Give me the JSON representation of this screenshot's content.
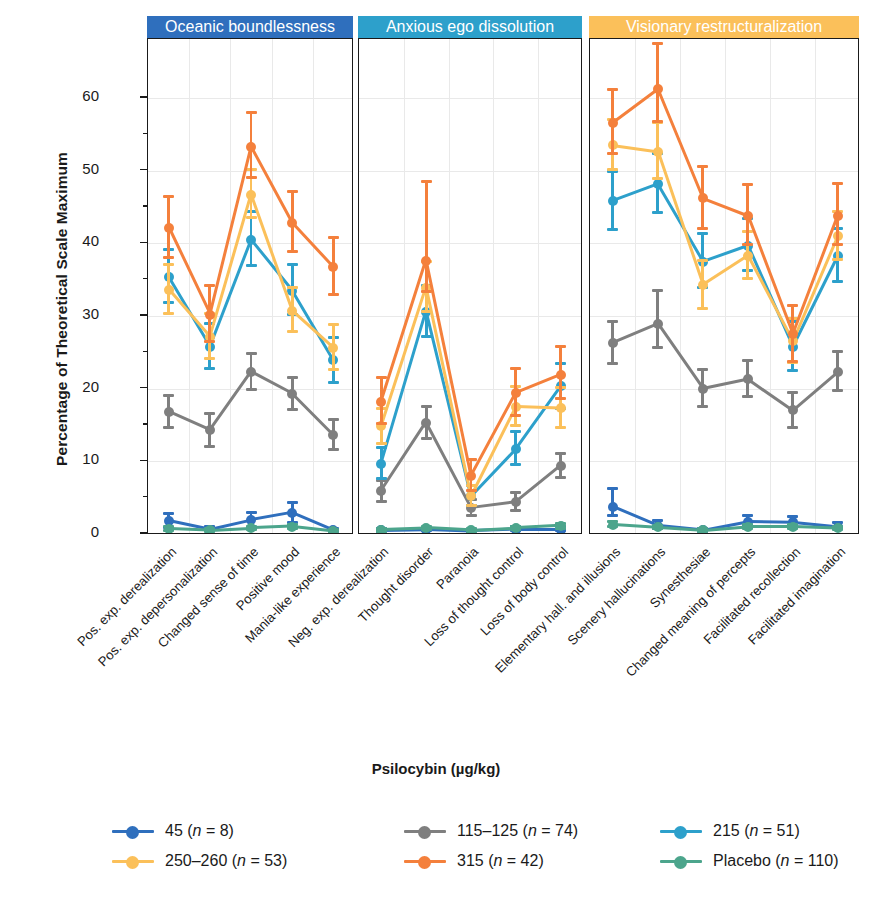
{
  "chart_data": {
    "type": "line",
    "title": "",
    "xlabel": "Psilocybin (µg/kg)",
    "ylabel": "Percentage of Theoretical Scale Maximum",
    "ylim": [
      0,
      68
    ],
    "yticks": [
      0,
      10,
      20,
      30,
      40,
      50,
      60
    ],
    "grid": true,
    "legend_position": "bottom",
    "panels": [
      {
        "label": "Oceanic boundlessness",
        "color": "#2f6fbd",
        "categories": [
          "Pos. exp. derealization",
          "Pos. exp. depersonalization",
          "Changed sense of time",
          "Positive mood",
          "Mania-like experience"
        ]
      },
      {
        "label": "Anxious ego dissolution",
        "color": "#2da0cb",
        "categories": [
          "Neg. exp. derealization",
          "Thought disorder",
          "Paranoia",
          "Loss of thought control",
          "Loss of body control"
        ]
      },
      {
        "label": "Visionary restructuralization",
        "color": "#fbc05a",
        "categories": [
          "Elementary hall. and illusions",
          "Scenery hallucinations",
          "Synesthesiae",
          "Changed meaning of percepts",
          "Facilitated recollection",
          "Facilitated imagination"
        ]
      }
    ],
    "series": [
      {
        "name": "45 (n = 8)",
        "dose": "45",
        "n": 8,
        "color": "#2f6fbd",
        "values": [
          [
            1.8,
            0.6,
            1.9,
            2.9,
            0.5
          ],
          [
            0.5,
            0.6,
            0.4,
            0.6,
            0.6
          ],
          [
            3.7,
            1.1,
            0.5,
            1.7,
            1.6,
            1.0
          ]
        ],
        "err_low": [
          [
            0.9,
            0.1,
            1.0,
            1.3,
            0.1
          ],
          [
            0.1,
            0.1,
            0.1,
            0.1,
            0.1
          ],
          [
            1.2,
            0.3,
            0.1,
            0.5,
            0.5,
            0.3
          ]
        ],
        "err_high": [
          [
            1.0,
            0.4,
            1.1,
            1.5,
            0.3
          ],
          [
            0.3,
            0.3,
            0.2,
            0.4,
            0.4
          ],
          [
            2.6,
            0.8,
            0.3,
            0.9,
            0.8,
            0.6
          ]
        ]
      },
      {
        "name": "115–125 (n = 74)",
        "dose": "115–125",
        "n": 74,
        "color": "#7f7f7f",
        "values": [
          [
            16.8,
            14.3,
            22.3,
            19.3,
            13.6
          ],
          [
            5.9,
            15.3,
            3.6,
            4.4,
            9.4
          ],
          [
            26.3,
            28.9,
            20.0,
            21.3,
            17.0,
            22.3
          ]
        ],
        "err_low": [
          [
            2.2,
            2.2,
            2.4,
            2.2,
            2.0
          ],
          [
            1.4,
            2.1,
            1.1,
            1.1,
            1.6
          ],
          [
            2.8,
            3.2,
            2.4,
            2.4,
            2.4,
            2.5
          ]
        ],
        "err_high": [
          [
            2.2,
            2.3,
            2.5,
            2.3,
            2.1
          ],
          [
            1.5,
            2.2,
            1.2,
            1.3,
            1.7
          ],
          [
            3.0,
            4.6,
            2.6,
            2.6,
            2.5,
            2.8
          ]
        ]
      },
      {
        "name": "215 (n = 51)",
        "dose": "215",
        "n": 51,
        "color": "#2da0cb",
        "values": [
          [
            35.3,
            25.8,
            40.5,
            33.5,
            23.9
          ],
          [
            9.7,
            30.6,
            5.2,
            11.7,
            20.3
          ],
          [
            45.8,
            48.1,
            37.5,
            39.7,
            25.8,
            38.3
          ]
        ],
        "err_low": [
          [
            3.5,
            3.0,
            3.6,
            3.3,
            3.0
          ],
          [
            2.0,
            3.4,
            1.3,
            2.2,
            3.0
          ],
          [
            3.9,
            3.9,
            3.6,
            3.5,
            3.3,
            3.6
          ]
        ],
        "err_high": [
          [
            3.9,
            3.2,
            3.9,
            3.6,
            3.2
          ],
          [
            2.2,
            3.6,
            1.5,
            2.4,
            3.2
          ],
          [
            4.1,
            4.2,
            3.8,
            3.7,
            3.5,
            3.8
          ]
        ]
      },
      {
        "name": "250–260 (n = 53)",
        "dose": "250–260",
        "n": 53,
        "color": "#fbc05a",
        "values": [
          [
            33.6,
            27.1,
            46.7,
            30.7,
            25.6
          ],
          [
            14.8,
            33.9,
            5.2,
            17.5,
            17.3
          ],
          [
            53.5,
            52.6,
            34.3,
            38.3,
            26.5,
            41.0
          ]
        ],
        "err_low": [
          [
            3.2,
            3.0,
            3.2,
            2.9,
            2.9
          ],
          [
            2.3,
            3.3,
            1.3,
            2.6,
            2.6
          ],
          [
            3.4,
            3.7,
            3.2,
            3.1,
            2.9,
            3.2
          ]
        ],
        "err_high": [
          [
            3.5,
            3.3,
            3.5,
            3.2,
            3.2
          ],
          [
            2.5,
            3.6,
            1.5,
            2.8,
            2.8
          ],
          [
            3.6,
            4.0,
            3.4,
            3.3,
            3.1,
            3.4
          ]
        ]
      },
      {
        "name": "315 (n = 42)",
        "dose": "315",
        "n": 42,
        "color": "#f4803c",
        "values": [
          [
            42.1,
            30.2,
            53.3,
            42.8,
            36.7
          ],
          [
            18.2,
            37.6,
            8.0,
            19.4,
            21.9
          ],
          [
            56.6,
            61.2,
            46.2,
            43.8,
            27.5,
            43.8
          ]
        ],
        "err_low": [
          [
            4.0,
            3.7,
            4.2,
            3.9,
            3.7
          ],
          [
            3.0,
            4.2,
            2.0,
            3.1,
            3.3
          ],
          [
            4.3,
            4.5,
            4.1,
            4.0,
            3.7,
            4.0
          ]
        ],
        "err_high": [
          [
            4.4,
            4.0,
            4.7,
            4.3,
            4.1
          ],
          [
            3.3,
            10.9,
            2.3,
            3.4,
            3.9
          ],
          [
            4.6,
            6.3,
            4.4,
            4.3,
            4.0,
            4.5
          ]
        ]
      },
      {
        "name": "Placebo (n = 110)",
        "dose": "Placebo",
        "n": 110,
        "color": "#4ca58c",
        "values": [
          [
            0.7,
            0.5,
            0.8,
            1.0,
            0.4
          ],
          [
            0.6,
            0.8,
            0.5,
            0.8,
            1.1
          ],
          [
            1.3,
            0.9,
            0.5,
            1.0,
            1.0,
            0.8
          ]
        ],
        "err_low": [
          [
            0.2,
            0.2,
            0.2,
            0.2,
            0.1
          ],
          [
            0.2,
            0.2,
            0.2,
            0.2,
            0.3
          ],
          [
            0.3,
            0.2,
            0.2,
            0.2,
            0.2,
            0.2
          ]
        ],
        "err_high": [
          [
            0.3,
            0.2,
            0.3,
            0.3,
            0.2
          ],
          [
            0.2,
            0.3,
            0.2,
            0.3,
            0.4
          ],
          [
            0.4,
            0.3,
            0.2,
            0.3,
            0.3,
            0.3
          ]
        ]
      }
    ]
  },
  "legend": {
    "rows": [
      [
        {
          "label_pre": "45 (",
          "n": "n",
          "label_post": " = 8)",
          "color": "#2f6fbd"
        },
        {
          "label_pre": "115–125 (",
          "n": "n",
          "label_post": " = 74)",
          "color": "#7f7f7f"
        },
        {
          "label_pre": "215 (",
          "n": "n",
          "label_post": " = 51)",
          "color": "#2da0cb"
        }
      ],
      [
        {
          "label_pre": "250–260 (",
          "n": "n",
          "label_post": " = 53)",
          "color": "#fbc05a"
        },
        {
          "label_pre": "315 (",
          "n": "n",
          "label_post": " = 42)",
          "color": "#f4803c"
        },
        {
          "label_pre": "Placebo (",
          "n": "n",
          "label_post": " = 110)",
          "color": "#4ca58c"
        }
      ]
    ]
  }
}
